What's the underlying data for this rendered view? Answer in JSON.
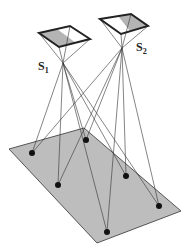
{
  "diagram": {
    "colors": {
      "ground_fill": "#bdbdbd",
      "ground_stroke": "#555555",
      "sensor_fill": "#b4b4b4",
      "sensor_stroke": "#222222",
      "ray": "#333333",
      "point": "#111111"
    },
    "ground_plane": [
      [
        9,
        149
      ],
      [
        84,
        128
      ],
      [
        181,
        211
      ],
      [
        97,
        243
      ]
    ],
    "sensors": [
      {
        "id": "s1",
        "label": "S",
        "subscript": "1",
        "label_pos": [
          38,
          70
        ],
        "square": [
          [
            39,
            33
          ],
          [
            70,
            26
          ],
          [
            90,
            39
          ],
          [
            59,
            47
          ]
        ],
        "shade": [
          [
            39,
            33
          ],
          [
            57,
            29
          ],
          [
            76,
            43
          ],
          [
            59,
            47
          ]
        ],
        "focal": [
          63,
          63
        ]
      },
      {
        "id": "s2",
        "label": "S",
        "subscript": "2",
        "label_pos": [
          136,
          51
        ],
        "square": [
          [
            100,
            19
          ],
          [
            131,
            14
          ],
          [
            148,
            26
          ],
          [
            121,
            34
          ]
        ],
        "shade": [
          [
            118,
            16
          ],
          [
            131,
            14
          ],
          [
            148,
            26
          ],
          [
            130,
            31
          ]
        ],
        "focal": [
          122,
          48
        ]
      }
    ],
    "points": [
      [
        32,
        153
      ],
      [
        58,
        185
      ],
      [
        86,
        140
      ],
      [
        126,
        176
      ],
      [
        159,
        206
      ],
      [
        107,
        232
      ]
    ]
  }
}
